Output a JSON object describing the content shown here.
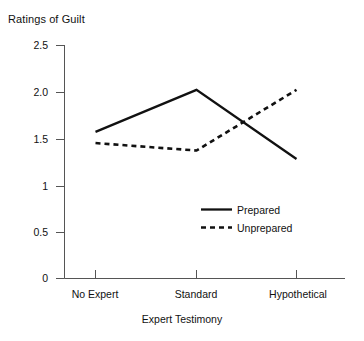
{
  "chart_data": {
    "type": "line",
    "title": "Ratings of Guilt",
    "xlabel": "Expert Testimony",
    "ylabel": "",
    "categories": [
      "No Expert",
      "Standard",
      "Hypothetical"
    ],
    "series": [
      {
        "name": "Prepared",
        "style": "solid",
        "values": [
          1.57,
          2.02,
          1.28
        ]
      },
      {
        "name": "Unprepared",
        "style": "dashed",
        "values": [
          1.45,
          1.37,
          2.02
        ]
      }
    ],
    "ylim": [
      0,
      2.5
    ],
    "yticks": [
      0,
      0.5,
      1,
      1.5,
      2.0,
      2.5
    ],
    "ytick_labels": [
      "0",
      "0.5",
      "1",
      "1.5",
      "2.0",
      "2.5"
    ],
    "grid": false,
    "legend_position": "inside-lower-right",
    "line_color": "#111111"
  },
  "legend": {
    "items": [
      {
        "label": "Prepared",
        "style": "solid"
      },
      {
        "label": "Unprepared",
        "style": "dashed"
      }
    ]
  }
}
